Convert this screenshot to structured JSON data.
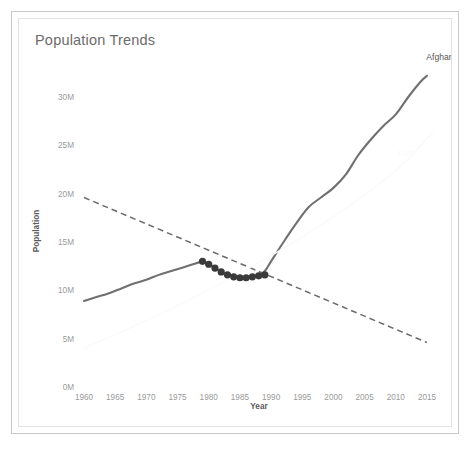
{
  "card": {
    "title": "Population Trends"
  },
  "chart_data": {
    "type": "line",
    "title": "Population Trends",
    "xlabel": "Year",
    "ylabel": "Population",
    "xlim": [
      1958,
      2017
    ],
    "ylim": [
      0,
      32
    ],
    "grid": false,
    "legend": "series-end-labels",
    "x_ticks": [
      "1960",
      "1965",
      "1970",
      "1975",
      "1980",
      "1985",
      "1990",
      "1995",
      "2000",
      "2005",
      "2010",
      "2015"
    ],
    "x_tick_values": [
      1960,
      1965,
      1970,
      1975,
      1980,
      1985,
      1990,
      1995,
      2000,
      2005,
      2010,
      2015
    ],
    "y_ticks": [
      "0M",
      "5M",
      "10M",
      "15M",
      "20M",
      "25M",
      "30M"
    ],
    "y_tick_values": [
      0,
      5,
      10,
      15,
      20,
      25,
      30
    ],
    "y_unit": "M",
    "series": [
      {
        "name": "Afghanistan",
        "style": "solid",
        "color": "#707070",
        "label_position": "end-top",
        "x": [
          1960,
          1962,
          1964,
          1966,
          1968,
          1970,
          1972,
          1974,
          1976,
          1978,
          1979,
          1980,
          1981,
          1982,
          1983,
          1984,
          1985,
          1986,
          1987,
          1988,
          1989,
          1990,
          1992,
          1994,
          1996,
          1998,
          2000,
          2002,
          2004,
          2006,
          2008,
          2010,
          2012,
          2014,
          2015
        ],
        "values": [
          8.9,
          9.3,
          9.7,
          10.2,
          10.7,
          11.1,
          11.6,
          12.0,
          12.4,
          12.8,
          13.0,
          12.7,
          12.3,
          11.9,
          11.6,
          11.4,
          11.3,
          11.3,
          11.4,
          11.5,
          12.0,
          13.0,
          15.0,
          16.9,
          18.6,
          19.6,
          20.6,
          22.0,
          24.0,
          25.6,
          27.0,
          28.2,
          30.0,
          31.6,
          32.2
        ]
      },
      {
        "name": "Trend",
        "style": "dashed",
        "color": "#6a6a6a",
        "label_position": "none",
        "x": [
          1960,
          2015
        ],
        "values": [
          19.6,
          4.6
        ]
      },
      {
        "name": "Faint",
        "style": "solid-faint",
        "color": "#fafafa",
        "label_position": "mid-right",
        "x": [
          1960,
          1975,
          1990,
          2000,
          2010,
          2016
        ],
        "values": [
          4.0,
          8.4,
          13.6,
          17.6,
          22.4,
          26.4
        ]
      }
    ],
    "markers": {
      "series": "Afghanistan",
      "color": "#3a3a3a",
      "radius": 3.6,
      "x": [
        1979,
        1980,
        1981,
        1982,
        1983,
        1984,
        1985,
        1986,
        1987,
        1988,
        1989
      ],
      "values": [
        13.0,
        12.7,
        12.3,
        11.9,
        11.6,
        11.4,
        11.3,
        11.3,
        11.4,
        11.5,
        11.6
      ]
    }
  }
}
